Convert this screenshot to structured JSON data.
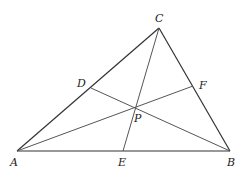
{
  "diagram": {
    "type": "triangle-cevians",
    "points": {
      "A": {
        "x": 17,
        "y": 151
      },
      "B": {
        "x": 230,
        "y": 151
      },
      "C": {
        "x": 159,
        "y": 28
      },
      "D": {
        "x": 91,
        "y": 88
      },
      "E": {
        "x": 123,
        "y": 151
      },
      "F": {
        "x": 193,
        "y": 86
      },
      "P": {
        "x": 135,
        "y": 107
      }
    },
    "labels": {
      "A": "A",
      "B": "B",
      "C": "C",
      "D": "D",
      "E": "E",
      "F": "F",
      "P": "P"
    },
    "segments": [
      [
        "A",
        "B"
      ],
      [
        "B",
        "C"
      ],
      [
        "C",
        "A"
      ],
      [
        "C",
        "E"
      ],
      [
        "A",
        "F"
      ],
      [
        "B",
        "D"
      ]
    ],
    "stroke_color": "#333333",
    "cevian_color": "#555555"
  }
}
